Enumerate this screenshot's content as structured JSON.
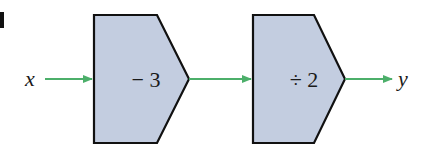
{
  "diagram": {
    "type": "function-machine",
    "input_label": "x",
    "output_label": "y",
    "machines": [
      {
        "operation": "− 3"
      },
      {
        "operation": "÷ 2"
      }
    ],
    "colors": {
      "box_fill": "#c3cde0",
      "box_stroke": "#111111",
      "arrow": "#4caf6a"
    }
  }
}
